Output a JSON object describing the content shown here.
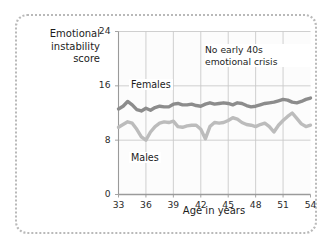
{
  "figure": {
    "background_color": "#ffffff",
    "border_style": "dotted-rounded",
    "border_color": "#b9b9b9"
  },
  "ylabel": {
    "line1": "Emotional",
    "line2": "instability",
    "line3": "score"
  },
  "xlabel": "Age in years",
  "annotation": {
    "line1": "No early 40s",
    "line2": "emotional crisis"
  },
  "series_labels": {
    "females": "Females",
    "males": "Males"
  },
  "chart_data": {
    "type": "line",
    "title": "",
    "subtitle": "",
    "xlabel": "Age in years",
    "ylabel": "Emotional instability score",
    "xlim": [
      33,
      54
    ],
    "ylim": [
      0,
      24
    ],
    "xticks": [
      33,
      36,
      39,
      42,
      45,
      48,
      51,
      54
    ],
    "yticks": [
      0,
      8,
      16,
      24
    ],
    "xtick_labels": [
      "33",
      "36",
      "39",
      "42",
      "45",
      "48",
      "51",
      "54"
    ],
    "ytick_labels": [
      "0",
      "8",
      "16",
      "24"
    ],
    "grid": {
      "vertical": [
        36,
        39,
        42,
        45,
        48,
        51
      ],
      "horizontal": [
        8,
        16,
        24
      ],
      "color": "#c9c9c9"
    },
    "legend_position": "inline-labels",
    "annotations": [
      {
        "text": "No early 40s emotional crisis",
        "x": 45.5,
        "y": 20.5
      }
    ],
    "x": [
      33,
      33.5,
      34,
      34.5,
      35,
      35.5,
      36,
      36.5,
      37,
      37.5,
      38,
      38.5,
      39,
      39.5,
      40,
      40.5,
      41,
      41.5,
      42,
      42.5,
      43,
      43.5,
      44,
      44.5,
      45,
      45.5,
      46,
      46.5,
      47,
      47.5,
      48,
      48.5,
      49,
      49.5,
      50,
      50.5,
      51,
      51.5,
      52,
      52.5,
      53,
      53.5,
      54
    ],
    "series": [
      {
        "name": "Females",
        "color": "#8c8c8c",
        "label_text": "Females",
        "values": [
          12.6,
          13.0,
          13.7,
          13.2,
          12.5,
          12.3,
          12.7,
          12.4,
          12.8,
          13.0,
          12.9,
          12.9,
          13.3,
          13.4,
          13.2,
          13.2,
          13.3,
          13.1,
          13.0,
          13.3,
          13.5,
          13.3,
          13.4,
          13.5,
          13.4,
          13.2,
          13.5,
          13.4,
          13.1,
          12.9,
          13.0,
          13.2,
          13.4,
          13.5,
          13.6,
          13.8,
          14.0,
          13.9,
          13.6,
          13.5,
          13.7,
          14.0,
          14.2
        ]
      },
      {
        "name": "Males",
        "color": "#bcbcbc",
        "label_text": "Males",
        "values": [
          9.9,
          10.3,
          10.7,
          10.5,
          9.6,
          8.5,
          8.0,
          9.2,
          10.0,
          10.5,
          10.7,
          10.6,
          10.8,
          10.0,
          9.9,
          10.1,
          10.2,
          10.2,
          9.6,
          8.2,
          10.0,
          10.6,
          10.5,
          10.6,
          10.9,
          11.3,
          11.1,
          10.6,
          10.3,
          10.2,
          10.0,
          10.3,
          10.5,
          10.0,
          9.2,
          10.2,
          10.9,
          11.5,
          12.0,
          11.2,
          10.4,
          10.0,
          10.2
        ]
      }
    ]
  }
}
